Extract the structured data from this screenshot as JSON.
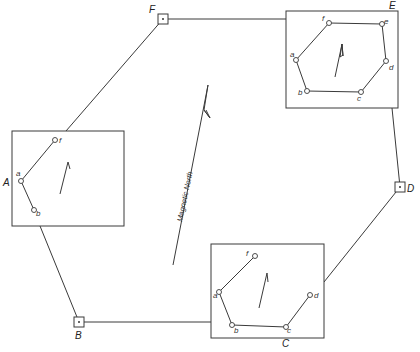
{
  "diagram": {
    "stations": {
      "A": {
        "label": "A"
      },
      "B": {
        "label": "B"
      },
      "C": {
        "label": "C"
      },
      "D": {
        "label": "D"
      },
      "E": {
        "label": "E"
      },
      "F": {
        "label": "F"
      }
    },
    "sub_points": [
      "a",
      "b",
      "c",
      "d",
      "e",
      "f"
    ],
    "magnetic_north_label": "Magnetic North",
    "colors": {
      "line": "#3a3a3a",
      "background": "#ffffff"
    }
  }
}
